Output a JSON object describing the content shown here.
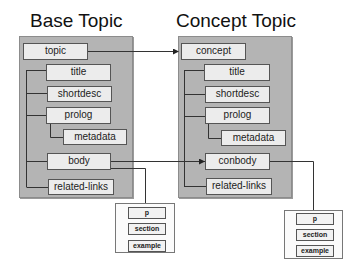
{
  "diagram": {
    "left": {
      "heading": "Base Topic",
      "root": "topic",
      "children": [
        "title",
        "shortdesc",
        "prolog",
        "metadata",
        "body",
        "related-links"
      ],
      "body_content": [
        "p",
        "section",
        "example"
      ]
    },
    "right": {
      "heading": "Concept Topic",
      "root": "concept",
      "children": [
        "title",
        "shortdesc",
        "prolog",
        "metadata",
        "conbody",
        "related-links"
      ],
      "body_content": [
        "p",
        "section",
        "example"
      ]
    },
    "arrows": [
      {
        "from": "topic",
        "to": "concept"
      },
      {
        "from": "body",
        "to": "conbody"
      }
    ],
    "colors": {
      "panel": "#b4b4b4",
      "node": "#ececec",
      "line": "#333333"
    }
  }
}
